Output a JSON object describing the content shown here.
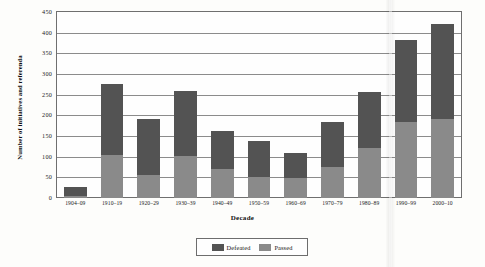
{
  "chart_data": {
    "type": "bar",
    "subtype": "stacked-vertical",
    "title": "",
    "xlabel": "Decade",
    "ylabel": "Number of initiatives and referenda",
    "ylim": [
      0,
      450
    ],
    "ytick_step": 50,
    "yticks": [
      "450",
      "400",
      "350",
      "300",
      "250",
      "200",
      "150",
      "100",
      "50",
      "0"
    ],
    "grid": true,
    "grid_axis": "y",
    "legend_position": "bottom-center",
    "categories": [
      "1904–09",
      "1910–19",
      "1920–29",
      "1930–39",
      "1940–49",
      "1950–59",
      "1960–69",
      "1970–79",
      "1980–89",
      "1990–99",
      "2000–10"
    ],
    "series": [
      {
        "name": "Defeated",
        "color": "#535353",
        "values": [
          22,
          170,
          137,
          158,
          93,
          87,
          60,
          110,
          137,
          198,
          228
        ]
      },
      {
        "name": "Passed",
        "color": "#8a8a8a",
        "values": [
          5,
          105,
          55,
          102,
          70,
          50,
          48,
          75,
          120,
          185,
          192
        ]
      }
    ],
    "totals": [
      27,
      275,
      192,
      260,
      163,
      137,
      108,
      185,
      257,
      383,
      420
    ]
  },
  "legend": {
    "items": [
      {
        "label": "Defeated",
        "color": "#535353",
        "swatch_name": "legend-swatch-defeated"
      },
      {
        "label": "Passed",
        "color": "#8a8a8a",
        "swatch_name": "legend-swatch-passed"
      }
    ]
  }
}
